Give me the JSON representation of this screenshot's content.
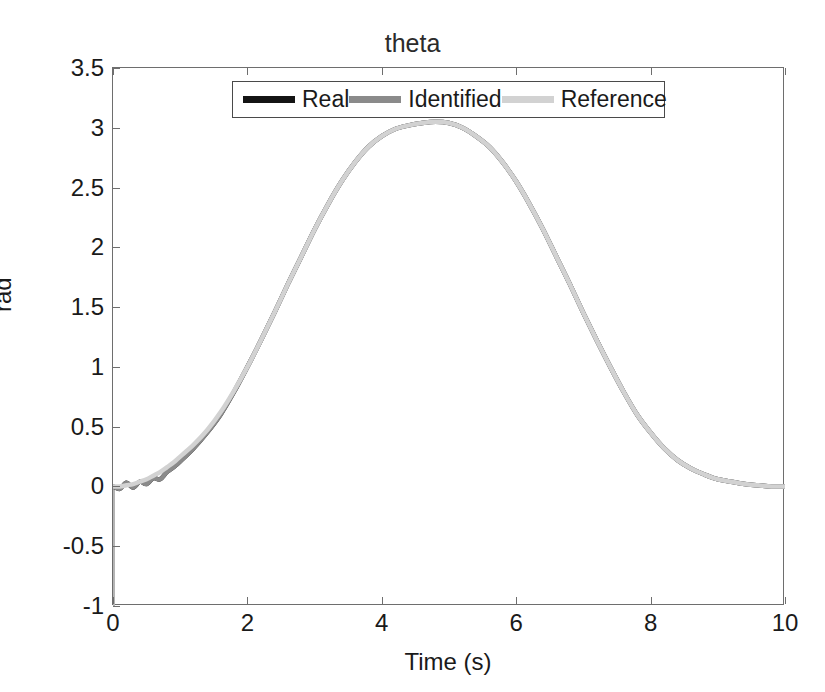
{
  "chart_data": {
    "type": "line",
    "title": "theta",
    "xlabel": "Time (s)",
    "ylabel": "rad",
    "xlim": [
      0,
      10
    ],
    "ylim": [
      -1,
      3.5
    ],
    "xticks": [
      0,
      2,
      4,
      6,
      8,
      10
    ],
    "xtick_labels": [
      "0",
      "2",
      "4",
      "6",
      "8",
      "10"
    ],
    "yticks": [
      -1,
      -0.5,
      0,
      0.5,
      1,
      1.5,
      2,
      2.5,
      3,
      3.5
    ],
    "ytick_labels": [
      "-1",
      "-0.5",
      "0",
      "0.5",
      "1",
      "1.5",
      "2",
      "2.5",
      "3",
      "3.5"
    ],
    "grid": false,
    "legend_position": "north",
    "legend": [
      {
        "name": "Real",
        "color": "#141414"
      },
      {
        "name": "Identified",
        "color": "#8a8a8a"
      },
      {
        "name": "Reference",
        "color": "#d2d2d2"
      }
    ],
    "x": [
      0,
      0.1,
      0.2,
      0.3,
      0.4,
      0.5,
      0.6,
      0.7,
      0.8,
      0.9,
      1.0,
      1.2,
      1.4,
      1.6,
      1.8,
      2.0,
      2.2,
      2.4,
      2.6,
      2.8,
      3.0,
      3.2,
      3.4,
      3.6,
      3.8,
      4.0,
      4.2,
      4.4,
      4.6,
      4.8,
      5.0,
      5.2,
      5.4,
      5.6,
      5.8,
      6.0,
      6.2,
      6.4,
      6.6,
      6.8,
      7.0,
      7.2,
      7.4,
      7.6,
      7.8,
      8.0,
      8.2,
      8.4,
      8.6,
      8.8,
      9.0,
      9.2,
      9.4,
      9.6,
      9.8,
      10.0
    ],
    "series": [
      {
        "name": "Real",
        "color": "#141414",
        "values": [
          0.0,
          -0.02,
          0.03,
          -0.01,
          0.04,
          0.02,
          0.07,
          0.06,
          0.12,
          0.16,
          0.21,
          0.32,
          0.45,
          0.6,
          0.79,
          1.0,
          1.22,
          1.45,
          1.69,
          1.92,
          2.15,
          2.36,
          2.55,
          2.71,
          2.84,
          2.93,
          2.99,
          3.02,
          3.04,
          3.05,
          3.04,
          3.0,
          2.93,
          2.84,
          2.71,
          2.55,
          2.36,
          2.15,
          1.92,
          1.69,
          1.45,
          1.22,
          1.0,
          0.79,
          0.6,
          0.45,
          0.32,
          0.22,
          0.15,
          0.1,
          0.06,
          0.04,
          0.02,
          0.01,
          0.0,
          0.0
        ]
      },
      {
        "name": "Identified",
        "color": "#8a8a8a",
        "values": [
          0.0,
          -0.02,
          0.03,
          -0.01,
          0.04,
          0.02,
          0.07,
          0.06,
          0.12,
          0.16,
          0.21,
          0.32,
          0.45,
          0.6,
          0.79,
          1.0,
          1.22,
          1.45,
          1.69,
          1.92,
          2.15,
          2.36,
          2.55,
          2.71,
          2.84,
          2.93,
          2.99,
          3.02,
          3.04,
          3.05,
          3.04,
          3.0,
          2.93,
          2.84,
          2.71,
          2.55,
          2.36,
          2.15,
          1.92,
          1.69,
          1.45,
          1.22,
          1.0,
          0.79,
          0.6,
          0.45,
          0.32,
          0.22,
          0.15,
          0.1,
          0.06,
          0.04,
          0.02,
          0.01,
          0.0,
          0.0
        ]
      },
      {
        "name": "Reference",
        "color": "#d2d2d2",
        "values": [
          0.0,
          0.0,
          0.01,
          0.02,
          0.04,
          0.06,
          0.09,
          0.12,
          0.16,
          0.2,
          0.25,
          0.35,
          0.47,
          0.62,
          0.8,
          1.0,
          1.22,
          1.45,
          1.69,
          1.92,
          2.15,
          2.36,
          2.55,
          2.71,
          2.84,
          2.93,
          2.99,
          3.02,
          3.04,
          3.05,
          3.04,
          3.0,
          2.93,
          2.84,
          2.71,
          2.55,
          2.36,
          2.15,
          1.92,
          1.69,
          1.45,
          1.22,
          1.0,
          0.79,
          0.6,
          0.45,
          0.32,
          0.22,
          0.15,
          0.1,
          0.06,
          0.04,
          0.02,
          0.01,
          0.0,
          0.0
        ]
      }
    ],
    "annotations": [
      {
        "name": "initial-vertical-transient",
        "x": 0.0,
        "y_from": -1.0,
        "y_to": 0.0,
        "color": "#b4b4b4"
      }
    ]
  }
}
